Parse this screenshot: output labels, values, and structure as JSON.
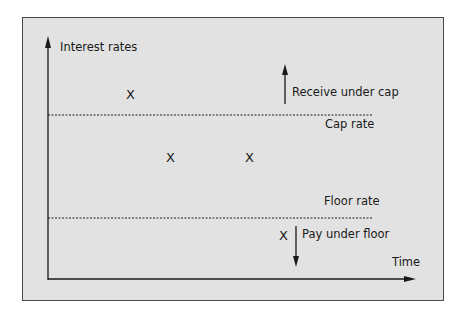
{
  "diagram": {
    "y_axis_label": "Interest rates",
    "x_axis_label": "Time",
    "cap_label": "Cap rate",
    "floor_label": "Floor rate",
    "receive_label": "Receive under cap",
    "pay_label": "Pay under floor",
    "marker": "X",
    "markers": [
      {
        "id": "above-cap",
        "symbol": "X"
      },
      {
        "id": "between-1",
        "symbol": "X"
      },
      {
        "id": "between-2",
        "symbol": "X"
      },
      {
        "id": "below-floor",
        "symbol": "X"
      }
    ],
    "colors": {
      "background": "#e2e2e2",
      "ink": "#1a1a1a",
      "frame": "#4a4a4a"
    }
  }
}
